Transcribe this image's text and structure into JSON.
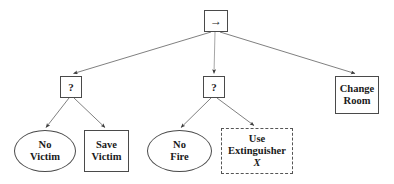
{
  "diagram": {
    "type": "behavior-tree",
    "background_color": "#ffffff",
    "stroke_color": "#4a4a4a",
    "edge_color": "#555555",
    "nodes": [
      {
        "id": "root-sequence",
        "name": "root-sequence-node",
        "shape": "rect",
        "label": "→",
        "semantic": "sequence",
        "x": 204,
        "y": 10,
        "w": 24,
        "h": 22
      },
      {
        "id": "selector-victim",
        "name": "selector-node-victim",
        "shape": "rect",
        "label": "?",
        "semantic": "fallback",
        "x": 60,
        "y": 76,
        "w": 22,
        "h": 22
      },
      {
        "id": "selector-fire",
        "name": "selector-node-fire",
        "shape": "rect",
        "label": "?",
        "semantic": "fallback",
        "x": 203,
        "y": 76,
        "w": 22,
        "h": 22
      },
      {
        "id": "change-room",
        "name": "action-change-room",
        "shape": "rect",
        "label": "Change\nRoom",
        "semantic": "action",
        "x": 335,
        "y": 76,
        "w": 44,
        "h": 38
      },
      {
        "id": "no-victim",
        "name": "condition-no-victim",
        "shape": "ellipse",
        "label": "No\nVictim",
        "semantic": "condition",
        "x": 14,
        "y": 130,
        "w": 62,
        "h": 42
      },
      {
        "id": "save-victim",
        "name": "action-save-victim",
        "shape": "rect",
        "label": "Save\nVictim",
        "semantic": "action",
        "x": 84,
        "y": 130,
        "w": 45,
        "h": 42
      },
      {
        "id": "no-fire",
        "name": "condition-no-fire",
        "shape": "ellipse",
        "label": "No\nFire",
        "semantic": "condition",
        "x": 147,
        "y": 130,
        "w": 65,
        "h": 42
      },
      {
        "id": "use-extinguisher",
        "name": "action-use-extinguisher",
        "shape": "rect-dashed",
        "label": "Use\nExtinguisher",
        "sublabel": "X",
        "semantic": "action-template",
        "x": 221,
        "y": 128,
        "w": 72,
        "h": 46
      }
    ],
    "edges": [
      {
        "name": "edge-root-to-selector-victim",
        "from": "root-sequence",
        "to": "selector-victim"
      },
      {
        "name": "edge-root-to-selector-fire",
        "from": "root-sequence",
        "to": "selector-fire"
      },
      {
        "name": "edge-root-to-change-room",
        "from": "root-sequence",
        "to": "change-room"
      },
      {
        "name": "edge-selector-victim-to-no-victim",
        "from": "selector-victim",
        "to": "no-victim"
      },
      {
        "name": "edge-selector-victim-to-save-victim",
        "from": "selector-victim",
        "to": "save-victim"
      },
      {
        "name": "edge-selector-fire-to-no-fire",
        "from": "selector-fire",
        "to": "no-fire"
      },
      {
        "name": "edge-selector-fire-to-use-extinguisher",
        "from": "selector-fire",
        "to": "use-extinguisher"
      }
    ]
  },
  "labels": {
    "root_arrow": "→",
    "selector_victim": "?",
    "selector_fire": "?",
    "change_room": "Change\nRoom",
    "no_victim": "No\nVictim",
    "save_victim": "Save\nVictim",
    "no_fire": "No\nFire",
    "use_extinguisher": "Use\nExtinguisher",
    "use_extinguisher_param": "X"
  }
}
